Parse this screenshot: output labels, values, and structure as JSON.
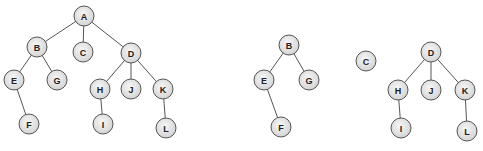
{
  "diagram": {
    "type": "tree-forest",
    "node_radius": 10,
    "colors": {
      "node_fill_center": "#f7f7f7",
      "node_fill_edge": "#d4d4d4",
      "stroke": "#555555",
      "label": "#222222"
    },
    "left_tree": {
      "nodes": [
        {
          "id": "A",
          "label": "A",
          "x": 84,
          "y": 16
        },
        {
          "id": "B",
          "label": "B",
          "x": 37,
          "y": 47
        },
        {
          "id": "C",
          "label": "C",
          "x": 83,
          "y": 52
        },
        {
          "id": "D",
          "label": "D",
          "x": 131,
          "y": 53
        },
        {
          "id": "E",
          "label": "E",
          "x": 14,
          "y": 80
        },
        {
          "id": "G",
          "label": "G",
          "x": 57,
          "y": 80
        },
        {
          "id": "F",
          "label": "F",
          "x": 29,
          "y": 124
        },
        {
          "id": "H",
          "label": "H",
          "x": 100,
          "y": 89
        },
        {
          "id": "J",
          "label": "J",
          "x": 131,
          "y": 89
        },
        {
          "id": "K",
          "label": "K",
          "x": 163,
          "y": 89
        },
        {
          "id": "I",
          "label": "I",
          "x": 103,
          "y": 124
        },
        {
          "id": "L",
          "label": "L",
          "x": 166,
          "y": 128
        }
      ],
      "edges": [
        [
          "A",
          "B"
        ],
        [
          "A",
          "C"
        ],
        [
          "A",
          "D"
        ],
        [
          "B",
          "E"
        ],
        [
          "B",
          "G"
        ],
        [
          "E",
          "F"
        ],
        [
          "D",
          "H"
        ],
        [
          "D",
          "J"
        ],
        [
          "D",
          "K"
        ],
        [
          "H",
          "I"
        ],
        [
          "K",
          "L"
        ]
      ]
    },
    "right_forest": {
      "nodes": [
        {
          "id": "B2",
          "label": "B",
          "x": 289,
          "y": 45
        },
        {
          "id": "E2",
          "label": "E",
          "x": 264,
          "y": 80
        },
        {
          "id": "G2",
          "label": "G",
          "x": 309,
          "y": 80
        },
        {
          "id": "F2",
          "label": "F",
          "x": 281,
          "y": 127
        },
        {
          "id": "C2",
          "label": "C",
          "x": 366,
          "y": 61
        },
        {
          "id": "D2",
          "label": "D",
          "x": 431,
          "y": 52
        },
        {
          "id": "H2",
          "label": "H",
          "x": 398,
          "y": 90
        },
        {
          "id": "J2",
          "label": "J",
          "x": 431,
          "y": 90
        },
        {
          "id": "K2",
          "label": "K",
          "x": 465,
          "y": 90
        },
        {
          "id": "I2",
          "label": "I",
          "x": 401,
          "y": 128
        },
        {
          "id": "L2",
          "label": "L",
          "x": 467,
          "y": 131
        }
      ],
      "edges": [
        [
          "B2",
          "E2"
        ],
        [
          "B2",
          "G2"
        ],
        [
          "E2",
          "F2"
        ],
        [
          "D2",
          "H2"
        ],
        [
          "D2",
          "J2"
        ],
        [
          "D2",
          "K2"
        ],
        [
          "H2",
          "I2"
        ],
        [
          "K2",
          "L2"
        ]
      ]
    }
  }
}
